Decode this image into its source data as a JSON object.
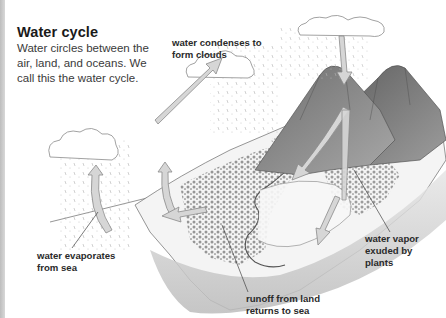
{
  "header": {
    "title": "Water cycle",
    "intro": "Water circles between the air, land, and oceans. We call this the water cycle."
  },
  "labels": {
    "condense": {
      "lines": [
        "water condenses to",
        "form clouds"
      ]
    },
    "evaporate": {
      "lines": [
        "water evaporates",
        "from sea"
      ]
    },
    "runoff": {
      "lines": [
        "runoff from land",
        "returns to sea"
      ]
    },
    "vapor": {
      "lines": [
        "water vapor",
        "exuded by",
        "plants"
      ]
    }
  },
  "diagram": {
    "elements": [
      "sea",
      "clouds",
      "rain",
      "mountains",
      "forest",
      "river",
      "coastline",
      "arrows"
    ],
    "colors": {
      "ink": "#2a2a2a",
      "arrow_fill": "#d6d6d6",
      "arrow_stroke": "#8a8a8a",
      "mountain_dark": "#7a7a7a",
      "mountain_light": "#b0b0b0",
      "forest": "#9a9a9a",
      "leader_line": "#444444"
    }
  }
}
